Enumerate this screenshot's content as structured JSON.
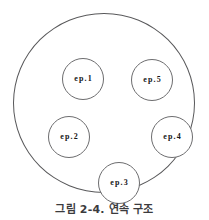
{
  "figure": {
    "caption": "그림 2-4. 연속 구조",
    "outer_set_name": "outer-boundary-circle",
    "colors": {
      "background": "#ffffff",
      "outer_stroke": "#58585a",
      "node_stroke": "#6d6d6f",
      "node_text": "#161616",
      "caption_text": "#3b3b3d"
    }
  },
  "nodes": [
    {
      "id": "ep1",
      "label": "ep.1",
      "position": "top-left"
    },
    {
      "id": "ep5",
      "label": "ep.5",
      "position": "top-right"
    },
    {
      "id": "ep2",
      "label": "ep.2",
      "position": "middle-left"
    },
    {
      "id": "ep4",
      "label": "ep.4",
      "position": "middle-right"
    },
    {
      "id": "ep3",
      "label": "ep.3",
      "position": "bottom-center"
    }
  ]
}
